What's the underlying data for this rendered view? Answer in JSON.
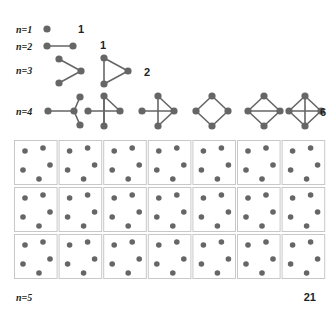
{
  "figure": {
    "node_color": "#666666",
    "edge_color": "#666666",
    "cell_border_color": "#c8c8c8",
    "background": "#ffffff",
    "text_color": "#231f20"
  },
  "rows": [
    {
      "id": "n1",
      "label": "n=1",
      "count": "1",
      "label_x": 16,
      "label_y": 33,
      "count_x": 78,
      "count_y": 33,
      "graphs": [
        {
          "id": "n1-g1",
          "name": "single-node",
          "ox": 47,
          "oy": 29,
          "nodes": [
            [
              0,
              0
            ]
          ],
          "edges": []
        }
      ]
    },
    {
      "id": "n2",
      "label": "n=2",
      "count": "1",
      "label_x": 16,
      "label_y": 50,
      "count_x": 100,
      "count_y": 49,
      "graphs": [
        {
          "id": "n2-g1",
          "name": "edge-graph",
          "ox": 47,
          "oy": 46,
          "nodes": [
            [
              0,
              0
            ],
            [
              26,
              0
            ]
          ],
          "edges": [
            [
              0,
              1
            ]
          ]
        }
      ]
    },
    {
      "id": "n3",
      "label": "n=3",
      "count": "2",
      "label_x": 16,
      "label_y": 74,
      "count_x": 144,
      "count_y": 76,
      "graphs": [
        {
          "id": "n3-g1",
          "name": "path-3",
          "ox": 59,
          "oy": 71,
          "nodes": [
            [
              0,
              -12
            ],
            [
              0,
              12
            ],
            [
              22,
              0
            ]
          ],
          "edges": [
            [
              0,
              2
            ],
            [
              1,
              2
            ]
          ]
        },
        {
          "id": "n3-g2",
          "name": "triangle-3",
          "ox": 104,
          "oy": 71,
          "nodes": [
            [
              0,
              -13
            ],
            [
              0,
              13
            ],
            [
              24,
              0
            ]
          ],
          "edges": [
            [
              0,
              1
            ],
            [
              0,
              2
            ],
            [
              1,
              2
            ]
          ]
        }
      ]
    },
    {
      "id": "n4",
      "label": "n=4",
      "count": "6",
      "label_x": 16,
      "label_y": 115,
      "count_x": 320,
      "count_y": 116,
      "graphs": [
        {
          "id": "n4-g1",
          "name": "star-4",
          "ox": 48,
          "oy": 111,
          "nodes": [
            [
              0,
              0
            ],
            [
              32,
              -14
            ],
            [
              32,
              14
            ],
            [
              26,
              0
            ]
          ],
          "edges": [
            [
              0,
              3
            ],
            [
              1,
              3
            ],
            [
              2,
              3
            ]
          ]
        },
        {
          "id": "n4-g2",
          "name": "triangle-plus-pendant",
          "ox": 104,
          "oy": 111,
          "nodes": [
            [
              -16,
              0
            ],
            [
              0,
              -15
            ],
            [
              0,
              15
            ],
            [
              16,
              0
            ]
          ],
          "edges": [
            [
              0,
              3
            ],
            [
              1,
              2
            ],
            [
              1,
              3
            ],
            [
              2,
              1
            ]
          ]
        },
        {
          "id": "n4-g3",
          "name": "paw-graph",
          "ox": 158,
          "oy": 111,
          "nodes": [
            [
              -16,
              0
            ],
            [
              0,
              -15
            ],
            [
              0,
              15
            ],
            [
              16,
              0
            ]
          ],
          "edges": [
            [
              0,
              3
            ],
            [
              1,
              3
            ],
            [
              2,
              3
            ],
            [
              1,
              2
            ]
          ]
        },
        {
          "id": "n4-g4",
          "name": "cycle-4",
          "ox": 212,
          "oy": 111,
          "nodes": [
            [
              -16,
              0
            ],
            [
              0,
              -15
            ],
            [
              0,
              15
            ],
            [
              16,
              0
            ]
          ],
          "edges": [
            [
              0,
              1
            ],
            [
              0,
              2
            ],
            [
              1,
              3
            ],
            [
              2,
              3
            ]
          ]
        },
        {
          "id": "n4-g5",
          "name": "diamond-graph",
          "ox": 264,
          "oy": 111,
          "nodes": [
            [
              -16,
              0
            ],
            [
              0,
              -15
            ],
            [
              0,
              15
            ],
            [
              16,
              0
            ]
          ],
          "edges": [
            [
              0,
              1
            ],
            [
              0,
              2
            ],
            [
              1,
              3
            ],
            [
              2,
              3
            ],
            [
              0,
              3
            ]
          ]
        },
        {
          "id": "n4-g6",
          "name": "complete-graph-4",
          "ox": 305,
          "oy": 111,
          "nodes": [
            [
              -16,
              0
            ],
            [
              0,
              -15
            ],
            [
              0,
              15
            ],
            [
              16,
              0
            ]
          ],
          "edges": [
            [
              0,
              1
            ],
            [
              0,
              2
            ],
            [
              1,
              3
            ],
            [
              2,
              3
            ],
            [
              0,
              3
            ],
            [
              1,
              2
            ]
          ]
        }
      ]
    }
  ],
  "grid": {
    "id": "n5",
    "label": "n=5",
    "count": "21",
    "label_x": 16,
    "label_y": 301,
    "count_x": 316,
    "count_y": 301,
    "columns": 7,
    "rows": 3,
    "cell_count": 21,
    "origin_x": 14,
    "origin_y": 140,
    "cell_width": 44.6,
    "cell_height": 47,
    "node_positions": [
      [
        11,
        11
      ],
      [
        29,
        8
      ],
      [
        36,
        25
      ],
      [
        25,
        39
      ],
      [
        9,
        30
      ]
    ]
  }
}
